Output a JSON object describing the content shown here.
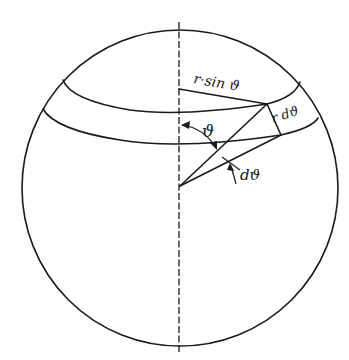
{
  "diagram": {
    "type": "geometry",
    "colors": {
      "ink": "#1a1a1a",
      "background": "#ffffff"
    },
    "labels": {
      "radius_sin": "r·sin ϑ",
      "arc_length": "r dϑ",
      "polar_angle": "ϑ",
      "angle_increment": "dϑ"
    },
    "elements": [
      {
        "id": "sphere-outline",
        "shape": "circle"
      },
      {
        "id": "polar-axis",
        "shape": "dashed vertical line"
      },
      {
        "id": "upper-band-circle",
        "shape": "ellipse arc",
        "at": "ϑ"
      },
      {
        "id": "lower-band-circle",
        "shape": "ellipse arc",
        "at": "ϑ + dϑ"
      },
      {
        "id": "radius-to-upper",
        "shape": "line",
        "from": "center",
        "to": "upper band point"
      },
      {
        "id": "radius-to-lower",
        "shape": "line",
        "from": "center",
        "to": "lower band point"
      },
      {
        "id": "horizontal-radius",
        "shape": "line",
        "label": "r·sin ϑ"
      },
      {
        "id": "arc-segment",
        "shape": "line",
        "label": "r dϑ"
      },
      {
        "id": "theta-arc",
        "shape": "arc with arrows",
        "label": "ϑ"
      },
      {
        "id": "dtheta-marker",
        "shape": "tick with arrow",
        "label": "dϑ"
      }
    ]
  }
}
